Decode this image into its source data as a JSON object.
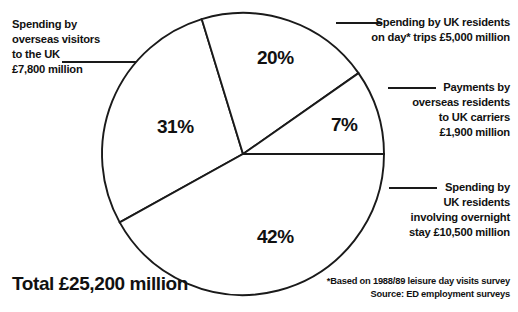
{
  "chart_data": {
    "type": "pie",
    "title": "",
    "total_label": "Total £25,200 million",
    "total_value": 25200,
    "units": "£ million",
    "categories": [
      "Spending by overseas visitors to the UK",
      "Spending by UK residents on day* trips",
      "Payments by overseas residents to UK carriers",
      "Spending by UK residents involving overnight stay"
    ],
    "values": [
      7800,
      5000,
      1900,
      10500
    ],
    "percentages": [
      31,
      20,
      7,
      42
    ],
    "slices": [
      {
        "id": "overseas-visitors-uk",
        "percent_label": "31%",
        "percent": 31,
        "amount": 7800,
        "amount_label": "£7,800 million",
        "start_deg": 241,
        "end_deg": 343,
        "label_x": 157,
        "label_y": 117
      },
      {
        "id": "uk-residents-day-trips",
        "percent_label": "20%",
        "percent": 20,
        "amount": 5000,
        "amount_label": "£5,000 million",
        "start_deg": 343,
        "end_deg": 415,
        "label_x": 257,
        "label_y": 48
      },
      {
        "id": "overseas-residents-uk-carriers",
        "percent_label": "7%",
        "percent": 7,
        "amount": 1900,
        "amount_label": "£1,900 million",
        "start_deg": 55,
        "end_deg": 90,
        "label_x": 331,
        "label_y": 115
      },
      {
        "id": "uk-residents-overnight",
        "percent_label": "42%",
        "percent": 42,
        "amount": 10500,
        "amount_label": "£10,500 million",
        "start_deg": 90,
        "end_deg": 241,
        "label_x": 257,
        "label_y": 227
      }
    ],
    "legend_position": "callouts",
    "grid": false,
    "colors": {
      "slice_fill": "#ffffff",
      "outline": "#1a1a1a",
      "text": "#111111",
      "background": "#ffffff"
    },
    "annotations": [
      "*Based on 1988/89 leisure day visits survey",
      "Source: ED employment surveys"
    ]
  },
  "callouts": {
    "overseas_visitors": {
      "lines": [
        "Spending by",
        "overseas visitors",
        "to the UK",
        "£7,800 million"
      ]
    },
    "day_trips": {
      "lines": [
        "Spending by UK residents",
        "on day* trips £5,000 million"
      ]
    },
    "uk_carriers": {
      "lines": [
        "Payments by",
        "overseas residents",
        "to UK carriers",
        "£1,900 million"
      ]
    },
    "overnight_stay": {
      "lines": [
        "Spending by",
        "UK residents",
        "involving overnight",
        "stay £10,500 million"
      ]
    }
  },
  "footnote": {
    "lines": [
      "*Based on 1988/89 leisure day visits survey",
      "Source: ED employment surveys"
    ]
  },
  "total": {
    "text": "Total £25,200 million"
  }
}
